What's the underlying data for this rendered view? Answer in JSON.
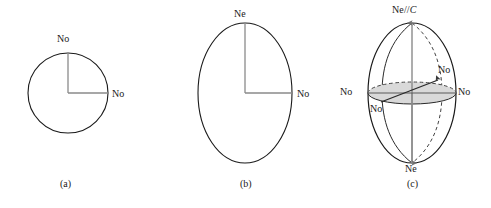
{
  "figure": {
    "background_color": "#ffffff",
    "outline_color": "#1a1a1a",
    "axis_color": "#808080",
    "disc_fill_color": "#d9d9d9",
    "dashed_color": "#555555"
  },
  "panels": [
    {
      "id": "a",
      "caption": "(a)",
      "shape": "circle",
      "geometry": {
        "cx": 68,
        "cy": 93,
        "r": 40
      },
      "labels": [
        {
          "name": "label-no-top",
          "text": "No",
          "x": 57,
          "y": 38
        },
        {
          "name": "label-no-right",
          "text": "No",
          "x": 112,
          "y": 88
        }
      ],
      "axes": [
        {
          "name": "radius-vertical",
          "from": [
            68,
            93
          ],
          "to": [
            68,
            53
          ]
        },
        {
          "name": "radius-horizontal",
          "from": [
            68,
            93
          ],
          "to": [
            108,
            93
          ]
        }
      ]
    },
    {
      "id": "b",
      "caption": "(b)",
      "shape": "ellipse",
      "geometry": {
        "cx": 245,
        "cy": 93,
        "rx": 47,
        "ry": 70
      },
      "labels": [
        {
          "name": "label-ne-top",
          "text": "Ne",
          "x": 234,
          "y": 12
        },
        {
          "name": "label-no-right",
          "text": "No",
          "x": 297,
          "y": 88
        }
      ],
      "axes": [
        {
          "name": "radius-vertical",
          "from": [
            245,
            93
          ],
          "to": [
            245,
            23
          ]
        },
        {
          "name": "radius-horizontal",
          "from": [
            245,
            93
          ],
          "to": [
            292,
            93
          ]
        }
      ]
    },
    {
      "id": "c",
      "caption": "(c)",
      "shape": "ellipsoid",
      "geometry": {
        "cx": 412,
        "cy": 93,
        "rx": 44,
        "ry": 70,
        "disc_ry": 11
      },
      "labels": [
        {
          "name": "label-ne-parallel-c-top",
          "text_prefix": "Ne",
          "text_sep": "//",
          "text_italic": "C",
          "x": 392,
          "y": 8
        },
        {
          "name": "label-no-left",
          "text": "No",
          "x": 341,
          "y": 86
        },
        {
          "name": "label-no-right",
          "text": "No",
          "x": 459,
          "y": 86
        },
        {
          "name": "label-no-diagonal-upper",
          "text": "No",
          "x": 438,
          "y": 67
        },
        {
          "name": "label-no-diagonal-lower",
          "text": "No",
          "x": 371,
          "y": 103
        },
        {
          "name": "label-ne-bottom",
          "text": "Ne",
          "x": 405,
          "y": 165
        }
      ],
      "axes": [
        {
          "name": "optic-axis-vertical",
          "from": [
            412,
            23
          ],
          "to": [
            412,
            163
          ]
        },
        {
          "name": "equator-axis-horizontal",
          "from": [
            368,
            93
          ],
          "to": [
            456,
            93
          ]
        },
        {
          "name": "diagonal-ray",
          "from": [
            383,
            101
          ],
          "to": [
            440,
            79
          ]
        }
      ]
    }
  ]
}
